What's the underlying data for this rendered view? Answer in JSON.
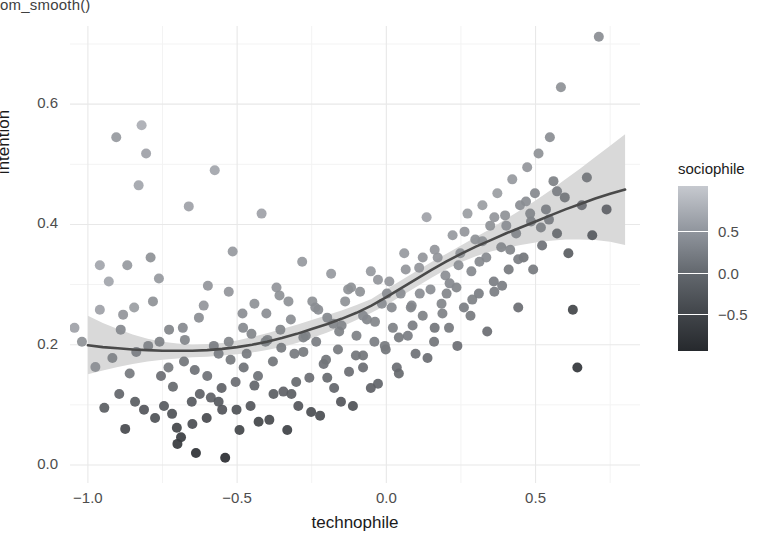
{
  "code_caption": "om_smooth()",
  "chart_data": {
    "type": "scatter",
    "title": "",
    "xlabel": "technophile",
    "ylabel": "intention",
    "xlim": [
      -1.06,
      0.85
    ],
    "ylim": [
      -0.03,
      0.73
    ],
    "xticks": [
      -1.0,
      -0.5,
      0.0,
      0.5
    ],
    "xtick_labels": [
      "−1.0",
      "−0.5",
      "0.0",
      "0.5"
    ],
    "yticks": [
      0.0,
      0.2,
      0.4,
      0.6
    ],
    "ytick_labels": [
      "0.0",
      "0.2",
      "0.4",
      "0.6"
    ],
    "grid": true,
    "grid_major_color": "#e8e8e8",
    "grid_minor_color": "#f3f3f3",
    "panel_background": "#ffffff",
    "point_size": 5.0,
    "colormap": "grey_light_to_dark",
    "smooth": {
      "method": "loess",
      "line_color": "#4a4a4a",
      "ribbon_color": "#d9d9d9",
      "x": [
        -1.0,
        -0.95,
        -0.9,
        -0.85,
        -0.8,
        -0.75,
        -0.7,
        -0.65,
        -0.6,
        -0.55,
        -0.5,
        -0.45,
        -0.4,
        -0.35,
        -0.3,
        -0.25,
        -0.2,
        -0.15,
        -0.1,
        -0.05,
        0.0,
        0.05,
        0.1,
        0.15,
        0.2,
        0.25,
        0.3,
        0.35,
        0.4,
        0.45,
        0.5,
        0.55,
        0.6,
        0.65,
        0.7,
        0.75,
        0.8
      ],
      "y": [
        0.199,
        0.196,
        0.194,
        0.192,
        0.191,
        0.19,
        0.19,
        0.19,
        0.191,
        0.193,
        0.196,
        0.2,
        0.205,
        0.211,
        0.218,
        0.226,
        0.234,
        0.243,
        0.253,
        0.265,
        0.279,
        0.294,
        0.309,
        0.324,
        0.338,
        0.351,
        0.363,
        0.374,
        0.385,
        0.395,
        0.405,
        0.415,
        0.425,
        0.434,
        0.443,
        0.451,
        0.458
      ],
      "ymin": [
        0.151,
        0.157,
        0.163,
        0.168,
        0.172,
        0.175,
        0.177,
        0.179,
        0.18,
        0.182,
        0.184,
        0.187,
        0.191,
        0.196,
        0.203,
        0.211,
        0.22,
        0.23,
        0.241,
        0.253,
        0.266,
        0.281,
        0.296,
        0.311,
        0.325,
        0.337,
        0.347,
        0.355,
        0.361,
        0.366,
        0.37,
        0.373,
        0.375,
        0.375,
        0.374,
        0.371,
        0.366
      ],
      "ymax": [
        0.248,
        0.236,
        0.226,
        0.217,
        0.21,
        0.205,
        0.202,
        0.2,
        0.201,
        0.203,
        0.207,
        0.213,
        0.219,
        0.226,
        0.233,
        0.241,
        0.249,
        0.257,
        0.266,
        0.276,
        0.292,
        0.307,
        0.322,
        0.337,
        0.351,
        0.365,
        0.379,
        0.393,
        0.409,
        0.424,
        0.44,
        0.457,
        0.475,
        0.493,
        0.512,
        0.531,
        0.55
      ]
    },
    "legend": {
      "title": "sociophile",
      "position": "right",
      "type": "colorbar",
      "ticks": [
        0.5,
        0.0,
        -0.5
      ],
      "tick_labels": [
        "0.5",
        "0.0",
        "−0.5"
      ],
      "range": [
        -0.95,
        1.05
      ],
      "gradient_low_color": "#26292d",
      "gradient_high_color": "#c6c9cf"
    },
    "points": [
      [
        -1.045,
        0.228,
        0.55
      ],
      [
        -1.02,
        0.205,
        0.35
      ],
      [
        -0.975,
        0.163,
        0.3
      ],
      [
        -0.96,
        0.258,
        0.55
      ],
      [
        -0.945,
        0.095,
        -0.3
      ],
      [
        -0.93,
        0.305,
        0.6
      ],
      [
        -0.905,
        0.545,
        0.45
      ],
      [
        -0.89,
        0.225,
        0.25
      ],
      [
        -0.875,
        0.06,
        -0.55
      ],
      [
        -0.86,
        0.152,
        0.05
      ],
      [
        -0.845,
        0.262,
        0.5
      ],
      [
        -0.83,
        0.465,
        0.6
      ],
      [
        -0.82,
        0.565,
        0.7
      ],
      [
        -0.805,
        0.518,
        0.55
      ],
      [
        -0.79,
        0.345,
        0.35
      ],
      [
        -0.775,
        0.078,
        -0.45
      ],
      [
        -0.76,
        0.205,
        0.15
      ],
      [
        -0.745,
        0.098,
        -0.35
      ],
      [
        -0.73,
        0.162,
        0.05
      ],
      [
        -0.715,
        0.13,
        -0.15
      ],
      [
        -0.7,
        0.035,
        -0.75
      ],
      [
        -0.688,
        0.046,
        -0.7
      ],
      [
        -0.675,
        0.208,
        0.2
      ],
      [
        -0.662,
        0.43,
        0.55
      ],
      [
        -0.65,
        0.068,
        -0.5
      ],
      [
        -0.638,
        0.02,
        -0.85
      ],
      [
        -0.625,
        0.118,
        -0.25
      ],
      [
        -0.612,
        0.265,
        0.4
      ],
      [
        -0.6,
        0.148,
        -0.05
      ],
      [
        -0.588,
        0.112,
        -0.25
      ],
      [
        -0.575,
        0.49,
        0.6
      ],
      [
        -0.562,
        0.185,
        0.1
      ],
      [
        -0.55,
        0.092,
        -0.4
      ],
      [
        -0.54,
        0.012,
        -0.9
      ],
      [
        -0.528,
        0.205,
        0.2
      ],
      [
        -0.515,
        0.355,
        0.45
      ],
      [
        -0.505,
        0.138,
        -0.1
      ],
      [
        -0.492,
        0.058,
        -0.6
      ],
      [
        -0.48,
        0.228,
        0.25
      ],
      [
        -0.468,
        0.185,
        0.05
      ],
      [
        -0.455,
        0.098,
        -0.4
      ],
      [
        -0.442,
        0.268,
        0.35
      ],
      [
        -0.43,
        0.148,
        -0.05
      ],
      [
        -0.418,
        0.418,
        0.55
      ],
      [
        -0.405,
        0.205,
        0.15
      ],
      [
        -0.392,
        0.075,
        -0.55
      ],
      [
        -0.38,
        0.172,
        0.0
      ],
      [
        -0.368,
        0.295,
        0.4
      ],
      [
        -0.355,
        0.225,
        0.2
      ],
      [
        -0.345,
        0.122,
        -0.25
      ],
      [
        -0.332,
        0.058,
        -0.65
      ],
      [
        -0.32,
        0.242,
        0.3
      ],
      [
        -0.308,
        0.185,
        0.05
      ],
      [
        -0.295,
        0.098,
        -0.4
      ],
      [
        -0.282,
        0.338,
        0.45
      ],
      [
        -0.27,
        0.215,
        0.15
      ],
      [
        -0.258,
        0.145,
        -0.1
      ],
      [
        -0.248,
        0.272,
        0.35
      ],
      [
        -0.235,
        0.205,
        0.1
      ],
      [
        -0.222,
        0.082,
        -0.5
      ],
      [
        -0.21,
        0.168,
        -0.05
      ],
      [
        -0.198,
        0.245,
        0.25
      ],
      [
        -0.185,
        0.318,
        0.45
      ],
      [
        -0.175,
        0.128,
        -0.2
      ],
      [
        -0.162,
        0.192,
        0.05
      ],
      [
        -0.15,
        0.232,
        0.2
      ],
      [
        -0.138,
        0.272,
        0.35
      ],
      [
        -0.125,
        0.155,
        -0.1
      ],
      [
        -0.112,
        0.098,
        -0.45
      ],
      [
        -0.1,
        0.215,
        0.15
      ],
      [
        -0.088,
        0.288,
        0.35
      ],
      [
        -0.078,
        0.182,
        0.0
      ],
      [
        -0.065,
        0.242,
        0.2
      ],
      [
        -0.052,
        0.322,
        0.45
      ],
      [
        -0.04,
        0.205,
        0.1
      ],
      [
        -0.028,
        0.135,
        -0.2
      ],
      [
        -0.015,
        0.268,
        0.3
      ],
      [
        -0.002,
        0.192,
        0.0
      ],
      [
        0.01,
        0.305,
        0.4
      ],
      [
        0.022,
        0.228,
        0.15
      ],
      [
        0.035,
        0.162,
        -0.1
      ],
      [
        0.048,
        0.285,
        0.3
      ],
      [
        0.06,
        0.352,
        0.45
      ],
      [
        0.072,
        0.215,
        0.1
      ],
      [
        0.085,
        0.265,
        0.25
      ],
      [
        0.098,
        0.185,
        -0.05
      ],
      [
        0.11,
        0.328,
        0.4
      ],
      [
        0.122,
        0.248,
        0.15
      ],
      [
        0.135,
        0.412,
        0.55
      ],
      [
        0.148,
        0.292,
        0.3
      ],
      [
        0.16,
        0.205,
        0.0
      ],
      [
        0.172,
        0.345,
        0.4
      ],
      [
        0.185,
        0.268,
        0.2
      ],
      [
        0.198,
        0.315,
        0.3
      ],
      [
        0.21,
        0.228,
        0.05
      ],
      [
        0.222,
        0.382,
        0.45
      ],
      [
        0.235,
        0.295,
        0.2
      ],
      [
        0.248,
        0.352,
        0.35
      ],
      [
        0.26,
        0.262,
        0.1
      ],
      [
        0.272,
        0.418,
        0.5
      ],
      [
        0.285,
        0.322,
        0.25
      ],
      [
        0.298,
        0.375,
        0.35
      ],
      [
        0.31,
        0.285,
        0.1
      ],
      [
        0.322,
        0.432,
        0.5
      ],
      [
        0.335,
        0.345,
        0.25
      ],
      [
        0.348,
        0.398,
        0.35
      ],
      [
        0.36,
        0.305,
        0.1
      ],
      [
        0.372,
        0.452,
        0.5
      ],
      [
        0.385,
        0.362,
        0.2
      ],
      [
        0.398,
        0.415,
        0.35
      ],
      [
        0.41,
        0.325,
        0.05
      ],
      [
        0.422,
        0.475,
        0.45
      ],
      [
        0.435,
        0.385,
        0.2
      ],
      [
        0.448,
        0.432,
        0.3
      ],
      [
        0.46,
        0.345,
        0.0
      ],
      [
        0.472,
        0.495,
        0.4
      ],
      [
        0.485,
        0.405,
        0.15
      ],
      [
        0.498,
        0.452,
        0.25
      ],
      [
        0.51,
        0.518,
        0.35
      ],
      [
        0.522,
        0.365,
        -0.05
      ],
      [
        0.535,
        0.425,
        0.1
      ],
      [
        0.548,
        0.545,
        0.3
      ],
      [
        0.56,
        0.472,
        0.15
      ],
      [
        0.572,
        0.385,
        -0.15
      ],
      [
        0.585,
        0.628,
        0.35
      ],
      [
        0.598,
        0.445,
        0.0
      ],
      [
        0.61,
        0.352,
        -0.3
      ],
      [
        0.625,
        0.258,
        -0.6
      ],
      [
        0.64,
        0.162,
        -0.8
      ],
      [
        0.655,
        0.432,
        -0.1
      ],
      [
        0.672,
        0.478,
        0.0
      ],
      [
        0.69,
        0.382,
        -0.35
      ],
      [
        0.712,
        0.712,
        0.3
      ],
      [
        0.738,
        0.425,
        -0.25
      ],
      [
        -0.895,
        0.118,
        -0.2
      ],
      [
        -0.868,
        0.332,
        0.45
      ],
      [
        -0.838,
        0.188,
        0.1
      ],
      [
        -0.812,
        0.092,
        -0.4
      ],
      [
        -0.782,
        0.272,
        0.35
      ],
      [
        -0.755,
        0.148,
        -0.1
      ],
      [
        -0.728,
        0.225,
        0.2
      ],
      [
        -0.702,
        0.062,
        -0.6
      ],
      [
        -0.678,
        0.172,
        0.0
      ],
      [
        -0.652,
        0.105,
        -0.35
      ],
      [
        -0.628,
        0.245,
        0.3
      ],
      [
        -0.602,
        0.078,
        -0.55
      ],
      [
        -0.578,
        0.198,
        0.1
      ],
      [
        -0.552,
        0.128,
        -0.25
      ],
      [
        -0.528,
        0.288,
        0.4
      ],
      [
        -0.502,
        0.092,
        -0.45
      ],
      [
        -0.478,
        0.162,
        -0.05
      ],
      [
        -0.452,
        0.218,
        0.2
      ],
      [
        -0.428,
        0.072,
        -0.6
      ],
      [
        -0.402,
        0.252,
        0.3
      ],
      [
        -0.378,
        0.118,
        -0.3
      ],
      [
        -0.352,
        0.195,
        0.05
      ],
      [
        -0.328,
        0.272,
        0.35
      ],
      [
        -0.302,
        0.138,
        -0.15
      ],
      [
        -0.278,
        0.212,
        0.15
      ],
      [
        -0.252,
        0.088,
        -0.5
      ],
      [
        -0.228,
        0.258,
        0.3
      ],
      [
        -0.202,
        0.175,
        0.0
      ],
      [
        -0.178,
        0.235,
        0.2
      ],
      [
        -0.152,
        0.105,
        -0.4
      ],
      [
        -0.128,
        0.292,
        0.35
      ],
      [
        -0.102,
        0.182,
        0.0
      ],
      [
        -0.078,
        0.248,
        0.25
      ],
      [
        -0.052,
        0.128,
        -0.25
      ],
      [
        -0.028,
        0.308,
        0.4
      ],
      [
        -0.005,
        0.198,
        0.05
      ],
      [
        0.018,
        0.262,
        0.25
      ],
      [
        0.042,
        0.152,
        -0.15
      ],
      [
        0.065,
        0.325,
        0.4
      ],
      [
        0.088,
        0.232,
        0.1
      ],
      [
        0.112,
        0.285,
        0.3
      ],
      [
        0.138,
        0.178,
        -0.1
      ],
      [
        0.162,
        0.358,
        0.4
      ],
      [
        0.188,
        0.252,
        0.15
      ],
      [
        0.212,
        0.302,
        0.25
      ],
      [
        0.238,
        0.198,
        -0.1
      ],
      [
        0.262,
        0.388,
        0.4
      ],
      [
        0.288,
        0.275,
        0.15
      ],
      [
        0.312,
        0.338,
        0.25
      ],
      [
        0.338,
        0.222,
        -0.1
      ],
      [
        0.362,
        0.412,
        0.4
      ],
      [
        0.388,
        0.298,
        0.1
      ],
      [
        0.415,
        0.358,
        0.2
      ],
      [
        0.442,
        0.262,
        -0.1
      ],
      [
        0.468,
        0.438,
        0.3
      ],
      [
        0.492,
        0.325,
        0.05
      ],
      [
        0.518,
        0.395,
        0.15
      ],
      [
        0.545,
        0.408,
        0.1
      ],
      [
        0.572,
        0.455,
        0.1
      ],
      [
        -0.96,
        0.332,
        0.6
      ],
      [
        -0.918,
        0.178,
        0.15
      ],
      [
        -0.882,
        0.25,
        0.4
      ],
      [
        -0.842,
        0.105,
        -0.3
      ],
      [
        -0.798,
        0.198,
        0.15
      ],
      [
        -0.762,
        0.31,
        0.45
      ],
      [
        -0.718,
        0.085,
        -0.45
      ],
      [
        -0.682,
        0.228,
        0.25
      ],
      [
        -0.642,
        0.158,
        -0.05
      ],
      [
        -0.598,
        0.298,
        0.4
      ],
      [
        -0.562,
        0.105,
        -0.35
      ],
      [
        -0.522,
        0.175,
        0.05
      ],
      [
        -0.482,
        0.252,
        0.3
      ],
      [
        -0.442,
        0.132,
        -0.2
      ],
      [
        -0.398,
        0.208,
        0.15
      ],
      [
        -0.358,
        0.282,
        0.35
      ],
      [
        -0.318,
        0.118,
        -0.3
      ],
      [
        -0.278,
        0.188,
        0.05
      ],
      [
        -0.238,
        0.262,
        0.3
      ],
      [
        -0.198,
        0.145,
        -0.15
      ],
      [
        -0.158,
        0.222,
        0.15
      ],
      [
        -0.118,
        0.295,
        0.35
      ],
      [
        -0.078,
        0.162,
        -0.1
      ],
      [
        -0.038,
        0.238,
        0.2
      ],
      [
        0.002,
        0.285,
        0.3
      ],
      [
        0.042,
        0.212,
        0.05
      ],
      [
        0.082,
        0.262,
        0.2
      ],
      [
        0.122,
        0.345,
        0.4
      ],
      [
        0.162,
        0.228,
        0.0
      ],
      [
        0.202,
        0.285,
        0.2
      ],
      [
        0.242,
        0.332,
        0.3
      ],
      [
        0.282,
        0.248,
        0.05
      ],
      [
        0.322,
        0.372,
        0.35
      ],
      [
        0.362,
        0.288,
        0.1
      ],
      [
        0.402,
        0.398,
        0.3
      ],
      [
        0.442,
        0.342,
        0.1
      ],
      [
        0.482,
        0.418,
        0.2
      ]
    ]
  }
}
